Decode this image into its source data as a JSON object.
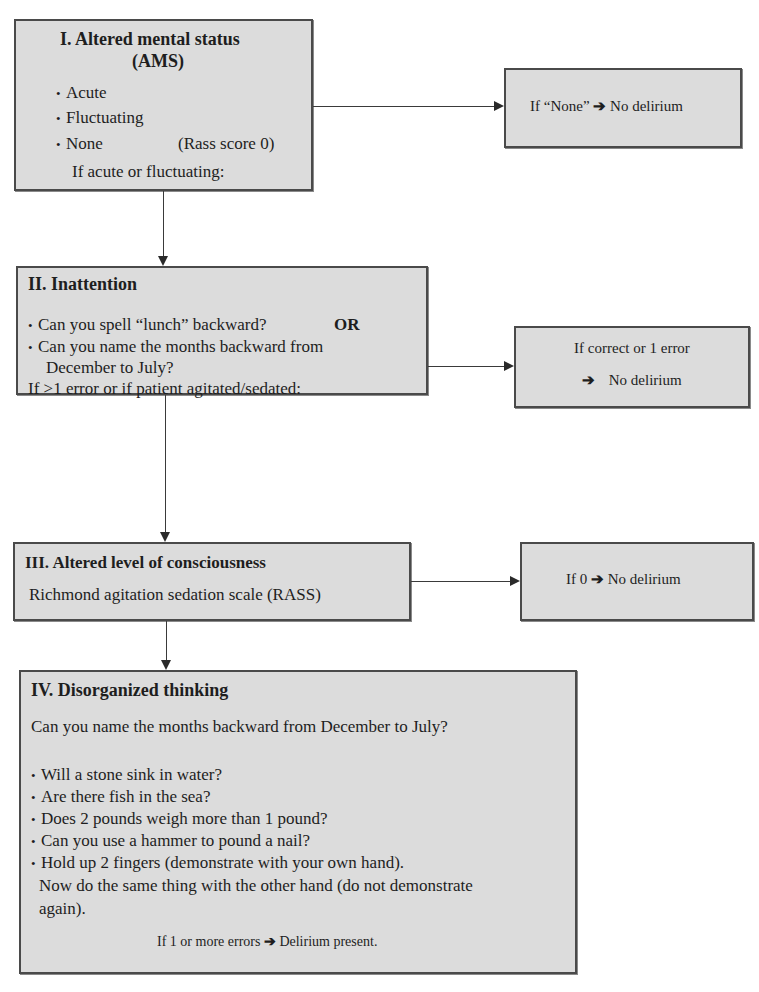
{
  "diagram": {
    "colors": {
      "box_fill": "#dcdcdc",
      "box_border": "#4a4a4a",
      "connector": "#3a3a3a",
      "background": "#ffffff"
    },
    "step1": {
      "title_line1": "I. Altered mental status",
      "title_line2": "(AMS)",
      "options": [
        "Acute",
        "Fluctuating",
        "None"
      ],
      "none_note": "(Rass score 0)",
      "condition": "If acute or fluctuating:",
      "outcome": {
        "prefix": "If “None”",
        "arrow": "➔",
        "result": "No delirium"
      }
    },
    "step2": {
      "title": "II. Inattention",
      "questions": [
        "Can you spell “lunch” backward?",
        "Can you name the months backward from",
        "December to July?"
      ],
      "or_label": "OR",
      "condition": "If >1 error or if patient agitated/sedated:",
      "outcome": {
        "line1": "If correct or 1 error",
        "arrow": "➔",
        "result": "No delirium"
      }
    },
    "step3": {
      "title": "III. Altered level of consciousness",
      "scale": "Richmond agitation sedation scale (RASS)",
      "outcome": {
        "prefix": "If 0",
        "arrow": "➔",
        "result": "No delirium"
      }
    },
    "step4": {
      "title": "IV. Disorganized thinking",
      "intro": "Can you name the months backward from December to July?",
      "questions": [
        "Will a stone sink in water?",
        "Are there fish in the sea?",
        "Does 2 pounds weigh more than 1 pound?",
        "Can you use a hammer to pound a nail?",
        "Hold up 2 fingers (demonstrate with your own hand)."
      ],
      "continuation_line1": "Now do the same thing with the other hand (do not demonstrate",
      "continuation_line2": "again).",
      "outcome": {
        "prefix": "If 1 or more errors",
        "arrow": "➔",
        "result": "Delirium present."
      }
    }
  }
}
